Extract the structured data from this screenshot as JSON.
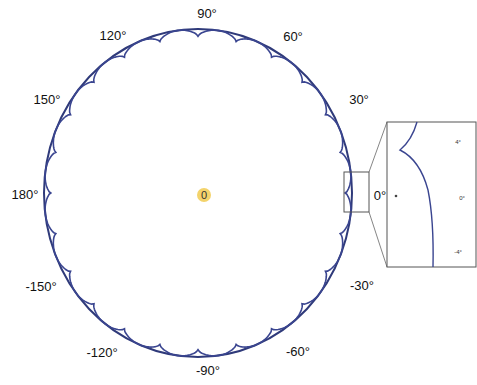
{
  "chart_data": {
    "type": "line",
    "subtype": "polar",
    "title": "",
    "center_label": "0",
    "angle_tick_labels": [
      "90°",
      "60°",
      "30°",
      "0°",
      "-30°",
      "-60°",
      "-90°",
      "-120°",
      "-150°",
      "180°",
      "150°",
      "120°"
    ],
    "series": [
      {
        "name": "envelope",
        "description": "near-circular outer boundary",
        "color": "#2f3a7a",
        "radius": 1.0
      },
      {
        "name": "scalloped",
        "description": "inner curve with periodic cusps (~every 15°)",
        "color": "#3a4590",
        "radius_base": 0.98,
        "cusp_count": 24
      }
    ],
    "inset": {
      "description": "zoomed view around 0°",
      "tick_labels": [
        "4°",
        "0°",
        "-4°"
      ],
      "marker": "•"
    },
    "grid": false,
    "legend": null
  },
  "colors": {
    "curve": "#2f3a7a",
    "origin_marker": "#f3d36b",
    "box": "#555555"
  }
}
